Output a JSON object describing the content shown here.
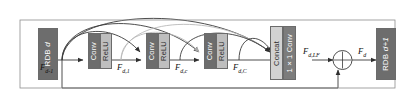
{
  "diagram": {
    "colors": {
      "conv_fill": "#6d6d6d",
      "relu_fill": "#bebebe",
      "concat_fill": "#d2d2d2",
      "one_by_one_conv_fill": "#7c7c7c",
      "rdb_fill": "#6d6d6d",
      "line_dark": "#3a3a3a",
      "line_light": "#b9b9b9",
      "background": "#ffffff"
    },
    "blocks": {
      "rdb_prev": {
        "label": "RDB",
        "index": "d"
      },
      "rdb_next": {
        "label": "RDB",
        "index": "d+1"
      },
      "conv": {
        "label": "Conv"
      },
      "relu": {
        "label": "ReLU"
      },
      "concat": {
        "label": "Concat"
      },
      "one_by_one_conv": {
        "label": "1×1 Conv"
      }
    },
    "signals": {
      "input": {
        "base": "F",
        "sub": "d-1"
      },
      "stage1": {
        "base": "F",
        "sub": "d,1"
      },
      "stage_c": {
        "base": "F",
        "sub": "d,c"
      },
      "stage_C": {
        "base": "F",
        "sub": "d,C"
      },
      "local_fusion": {
        "base": "F",
        "sub": "d,LF"
      },
      "output": {
        "base": "F",
        "sub": "d"
      }
    },
    "operators": {
      "sum": {
        "symbol": "+",
        "name": "element-wise-addition"
      }
    }
  }
}
